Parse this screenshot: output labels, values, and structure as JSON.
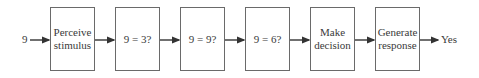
{
  "diagram": {
    "input_label": "9",
    "output_label": "Yes",
    "steps": [
      {
        "label": "Perceive stimulus"
      },
      {
        "label": "9 = 3?"
      },
      {
        "label": "9 = 9?"
      },
      {
        "label": "9 = 6?"
      },
      {
        "label": "Make decision"
      },
      {
        "label": "Generate response"
      }
    ],
    "colors": {
      "stroke": "#6a6a6a",
      "arrow": "#333333",
      "text": "#3a3a3a"
    }
  }
}
